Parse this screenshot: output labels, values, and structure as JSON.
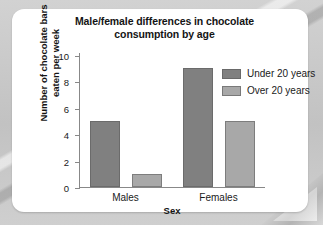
{
  "chart_data": {
    "type": "bar",
    "title": "Male/female differences in chocolate consumption by age",
    "title_line1": "Male/female differences in chocolate",
    "title_line2": "consumption by age",
    "xlabel": "Sex",
    "ylabel": "Number of chocolate bars eaten per week",
    "ylabel_line1": "Number of chocolate bars",
    "ylabel_line2": "eaten per week",
    "categories": [
      "Males",
      "Females"
    ],
    "series": [
      {
        "name": "Under 20 years",
        "values": [
          5,
          9
        ],
        "color": "#808080"
      },
      {
        "name": "Over 20 years",
        "values": [
          1,
          5
        ],
        "color": "#a8a8a8"
      }
    ],
    "ylim": [
      0,
      10
    ],
    "yticks": [
      0,
      2,
      4,
      6,
      8,
      10
    ],
    "ytick_labels": [
      "0",
      "2",
      "4",
      "6",
      "8",
      "10"
    ],
    "grid": false,
    "legend_position": "top-right"
  },
  "legend": {
    "items": [
      {
        "label": "Under 20 years",
        "color": "#808080"
      },
      {
        "label": "Over 20 years",
        "color": "#a8a8a8"
      }
    ]
  }
}
